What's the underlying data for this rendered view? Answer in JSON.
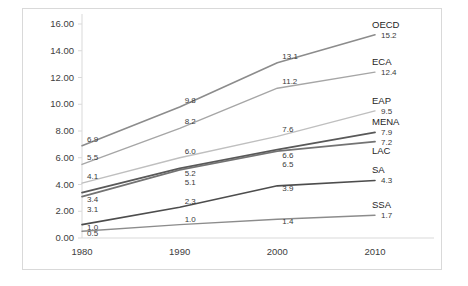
{
  "chart_data": {
    "type": "line",
    "title": "",
    "subtitle": "",
    "xlabel": "",
    "ylabel": "",
    "categories": [
      "1980",
      "1990",
      "2000",
      "2010"
    ],
    "x": [
      1980,
      1990,
      2000,
      2010
    ],
    "xlim": [
      1980,
      2010
    ],
    "ylim": [
      0.0,
      16.0
    ],
    "ytick_labels": [
      "0.00",
      "2.00",
      "4.00",
      "6.00",
      "8.00",
      "10.00",
      "12.00",
      "14.00",
      "16.00"
    ],
    "ytick_values": [
      0,
      2,
      4,
      6,
      8,
      10,
      12,
      14,
      16
    ],
    "grid": false,
    "legend": "series-end-labels",
    "data_labels": true,
    "series": [
      {
        "name": "OECD",
        "color": "#8c8c8c",
        "width": 1.6,
        "values": [
          6.9,
          9.8,
          13.1,
          15.2
        ],
        "labels": [
          "6.9",
          "9.8",
          "13.1",
          "15.2"
        ],
        "end_label": "15.2"
      },
      {
        "name": "ECA",
        "color": "#a6a6a6",
        "width": 1.4,
        "values": [
          5.5,
          8.2,
          11.2,
          12.4
        ],
        "labels": [
          "5.5",
          "8.2",
          "11.2",
          "12.4"
        ],
        "end_label": "12.4"
      },
      {
        "name": "EAP",
        "color": "#bfbfbf",
        "width": 1.4,
        "values": [
          4.1,
          6.0,
          7.6,
          9.5
        ],
        "labels": [
          "4.1",
          "6.0",
          "7.6",
          "9.5"
        ],
        "end_label": "9.5"
      },
      {
        "name": "MENA",
        "color": "#595959",
        "width": 1.8,
        "values": [
          3.4,
          5.2,
          6.6,
          7.9
        ],
        "labels": [
          "3.4",
          "5.2",
          "6.6",
          "7.9"
        ],
        "end_label": "7.9"
      },
      {
        "name": "LAC",
        "color": "#737373",
        "width": 1.8,
        "values": [
          3.1,
          5.1,
          6.5,
          7.2
        ],
        "labels": [
          "3.1",
          "5.1",
          "6.5",
          "7.2"
        ],
        "end_label": "7.2"
      },
      {
        "name": "SA",
        "color": "#4d4d4d",
        "width": 1.6,
        "values": [
          1.0,
          2.3,
          3.9,
          4.3
        ],
        "labels": [
          "1.0",
          "2.3",
          "3.9",
          "4.3"
        ],
        "end_label": "4.3"
      },
      {
        "name": "SSA",
        "color": "#8c8c8c",
        "width": 1.4,
        "values": [
          0.5,
          1.0,
          1.4,
          1.7
        ],
        "labels": [
          "0.5",
          "1.0",
          "1.4",
          "1.7"
        ],
        "end_label": "1.7"
      }
    ]
  },
  "axis": {
    "axis_line_color": "#d9d9d9",
    "border_color": "#d9d9d9"
  }
}
